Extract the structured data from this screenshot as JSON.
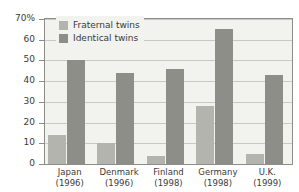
{
  "chart_data": {
    "type": "bar",
    "title": "",
    "xlabel": "",
    "ylabel": "",
    "ylim": [
      0,
      70
    ],
    "yticks": [
      0,
      10,
      20,
      30,
      40,
      50,
      60,
      70
    ],
    "ytick_labels": [
      "0",
      "10",
      "20",
      "30",
      "40",
      "50",
      "60",
      "70%"
    ],
    "grid": true,
    "legend_position": "top-left-inside",
    "categories": [
      "Japan",
      "Denmark",
      "Finland",
      "Germany",
      "U.K."
    ],
    "category_years": [
      "(1996)",
      "(1996)",
      "(1998)",
      "(1998)",
      "(1999)"
    ],
    "series": [
      {
        "name": "Fraternal twins",
        "color": "#b4b4ae",
        "values": [
          14,
          10,
          4,
          28,
          5
        ]
      },
      {
        "name": "Identical twins",
        "color": "#8e8e89",
        "values": [
          50,
          44,
          46,
          65,
          43
        ]
      }
    ]
  },
  "colors": {
    "plot_background": "#f2f2ef",
    "page_background": "#ffffff",
    "gridline": "#c9c9c4",
    "axis": "#8d8d88",
    "text": "#3a3a38",
    "fraternal": "#b4b4ae",
    "identical": "#8e8e89"
  }
}
